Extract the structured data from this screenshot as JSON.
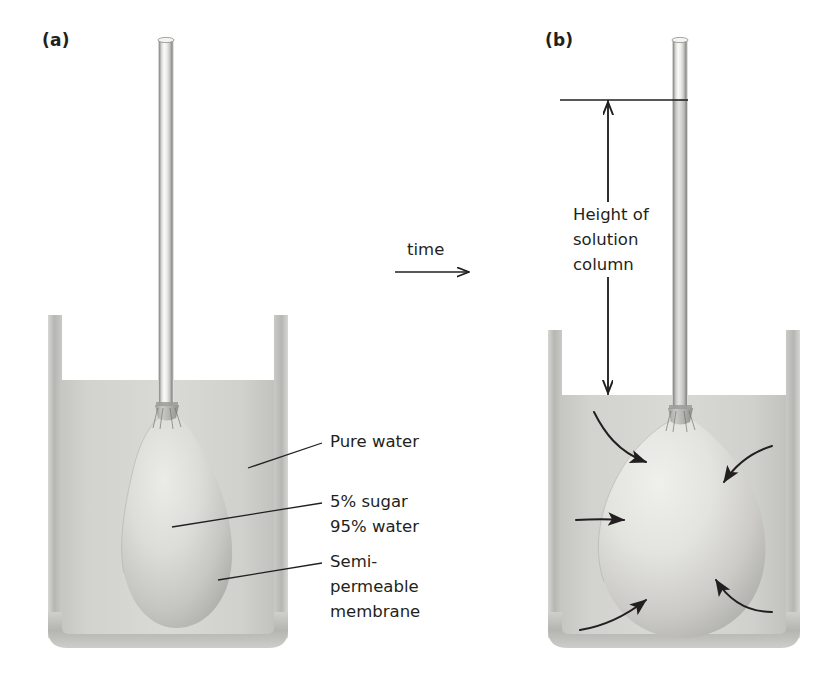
{
  "figure": {
    "width": 837,
    "height": 678,
    "background": "#ffffff"
  },
  "panels": [
    {
      "id": "a",
      "label": "(a)",
      "label_x": 42,
      "label_y": 38,
      "description": "Beaker of pure water with a semi-permeable membrane bag of sugar solution attached to a glass tube; bag is pear shaped and no solution has risen in the tube.",
      "beaker": {
        "x": 48,
        "y": 315,
        "width": 240,
        "height": 333
      },
      "water_level_y": 380,
      "tube": {
        "x": 158,
        "y": 36,
        "width": 16,
        "height": 372
      },
      "tube_fill_top_y": null,
      "bag": {
        "cx": 168,
        "cy": 520,
        "rx": 62,
        "ry": 108,
        "shape": "pear"
      },
      "arrows": []
    },
    {
      "id": "b",
      "label": "(b)",
      "label_x": 545,
      "label_y": 38,
      "description": "After time has passed the bag has swollen round and solution has risen up the glass tube; five arrows show water entering the bag.",
      "beaker": {
        "x": 548,
        "y": 330,
        "width": 252,
        "height": 318
      },
      "water_level_y": 395,
      "tube": {
        "x": 672,
        "y": 36,
        "width": 16,
        "height": 380
      },
      "tube_fill_top_y": 100,
      "bag": {
        "cx": 680,
        "cy": 520,
        "rx": 84,
        "ry": 112,
        "shape": "round"
      },
      "arrows": [
        {
          "name": "water-inflow-arrow-top-left"
        },
        {
          "name": "water-inflow-arrow-top-right"
        },
        {
          "name": "water-inflow-arrow-left"
        },
        {
          "name": "water-inflow-arrow-bottom-left"
        },
        {
          "name": "water-inflow-arrow-bottom-right"
        }
      ]
    }
  ],
  "callouts": [
    {
      "id": "pure-water",
      "text": "Pure water",
      "text_x": 330,
      "text_y": 441,
      "leader": {
        "x1": 248,
        "y1": 468,
        "x2": 322,
        "y2": 443
      }
    },
    {
      "id": "sugar-solution",
      "text": "5% sugar\n95% water",
      "text_x": 330,
      "text_y": 500,
      "leader": {
        "x1": 172,
        "y1": 527,
        "x2": 322,
        "y2": 503
      }
    },
    {
      "id": "semi-permeable-membrane",
      "text": "Semi-\npermeable\nmembrane",
      "text_x": 330,
      "text_y": 560,
      "leader": {
        "x1": 218,
        "y1": 580,
        "x2": 322,
        "y2": 563
      }
    }
  ],
  "time_arrow": {
    "label": "time",
    "label_x": 407,
    "label_y": 240,
    "line": {
      "x1": 395,
      "y1": 272,
      "x2": 470,
      "y2": 272
    },
    "direction": "right"
  },
  "height_measure": {
    "label": "Height of\nsolution\ncolumn",
    "label_x": 573,
    "label_y": 202,
    "reference_line": {
      "x1": 560,
      "y1": 100,
      "x2": 688,
      "y2": 100
    },
    "arrow": {
      "x": 608,
      "y_top": 100,
      "y_bottom": 395,
      "heads": "both"
    }
  },
  "colors": {
    "text": "#231f20",
    "line": "#231f20",
    "glass_edge": "#8c8c8c",
    "glass_light": "#f2f2f2",
    "water": "#cfcfcd",
    "water_light": "#dcdcda",
    "beaker_wall": "#bdbdbb",
    "beaker_wall_dark": "#a8a8a6",
    "bag_light": "#e2e2df",
    "bag_mid": "#cdcdc9",
    "bag_shadow": "#b2b2ae",
    "solution_in_tube": "#c6c6c4"
  }
}
